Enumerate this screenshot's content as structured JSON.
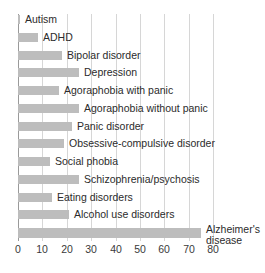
{
  "chart_data": {
    "type": "bar",
    "orientation": "horizontal",
    "title": "",
    "xlabel": "",
    "ylabel": "",
    "categories": [
      "Autism",
      "ADHD",
      "Bipolar disorder",
      "Depression",
      "Agoraphobia with panic",
      "Agoraphobia without panic",
      "Panic disorder",
      "Obsessive-compulsive disorder",
      "Social phobia",
      "Schizophrenia/psychosis",
      "Eating disorders",
      "Alcohol use disorders",
      "Alzheimer's disease"
    ],
    "values": [
      1,
      8,
      18,
      25,
      17,
      25,
      22,
      19,
      13,
      25,
      14,
      21,
      75
    ],
    "xticks": [
      0,
      10,
      20,
      30,
      40,
      50,
      60,
      70,
      80
    ],
    "xlim": [
      0,
      80
    ],
    "grid": "vertical",
    "legend": "none",
    "bar_color": "#bdbdbd",
    "label_position": "right of bar"
  }
}
